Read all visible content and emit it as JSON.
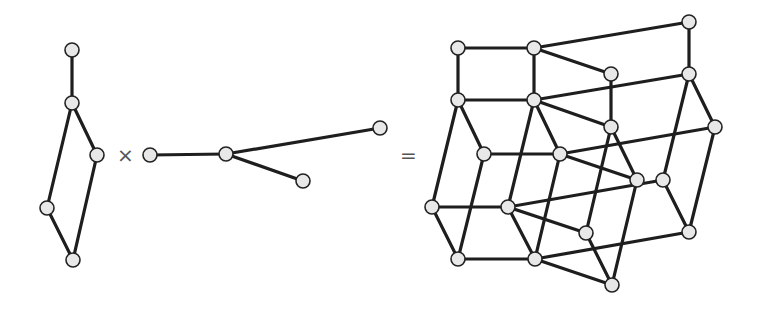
{
  "diagram": {
    "colors": {
      "edge": "#1e1e1e",
      "node_fill": "#e8e8e8",
      "node_stroke": "#222222",
      "operator": "#555555"
    },
    "node_radius": 7,
    "operators": [
      {
        "name": "times-operator",
        "symbol": "×",
        "x": 117,
        "y": 145
      },
      {
        "name": "equals-operator",
        "symbol": "=",
        "x": 400,
        "y": 145
      }
    ],
    "graphs": [
      {
        "name": "graph-g",
        "nodes": [
          [
            72,
            50
          ],
          [
            72,
            103
          ],
          [
            97,
            155
          ],
          [
            47,
            208
          ],
          [
            73,
            260
          ]
        ],
        "edges": [
          [
            0,
            1
          ],
          [
            1,
            2
          ],
          [
            1,
            3
          ],
          [
            2,
            4
          ],
          [
            3,
            4
          ]
        ]
      },
      {
        "name": "graph-h",
        "nodes": [
          [
            150,
            155
          ],
          [
            226,
            154
          ],
          [
            380,
            128
          ],
          [
            303,
            181
          ]
        ],
        "edges": [
          [
            0,
            1
          ],
          [
            1,
            2
          ],
          [
            1,
            3
          ]
        ]
      },
      {
        "name": "product-graph",
        "nodes": [
          [
            458,
            48
          ],
          [
            458,
            100
          ],
          [
            484,
            154
          ],
          [
            432,
            207
          ],
          [
            458,
            259
          ],
          [
            534,
            48
          ],
          [
            534,
            100
          ],
          [
            560,
            154
          ],
          [
            508,
            207
          ],
          [
            535,
            259
          ],
          [
            689,
            22
          ],
          [
            689,
            74
          ],
          [
            715,
            127
          ],
          [
            663,
            180
          ],
          [
            689,
            232
          ],
          [
            611,
            74
          ],
          [
            611,
            127
          ],
          [
            637,
            180
          ],
          [
            586,
            233
          ],
          [
            612,
            285
          ]
        ],
        "edges": [
          [
            0,
            1
          ],
          [
            1,
            2
          ],
          [
            1,
            3
          ],
          [
            2,
            4
          ],
          [
            3,
            4
          ],
          [
            5,
            6
          ],
          [
            6,
            7
          ],
          [
            6,
            8
          ],
          [
            7,
            9
          ],
          [
            8,
            9
          ],
          [
            10,
            11
          ],
          [
            11,
            12
          ],
          [
            11,
            13
          ],
          [
            12,
            14
          ],
          [
            13,
            14
          ],
          [
            15,
            16
          ],
          [
            16,
            17
          ],
          [
            16,
            18
          ],
          [
            17,
            19
          ],
          [
            18,
            19
          ],
          [
            0,
            5
          ],
          [
            1,
            6
          ],
          [
            2,
            7
          ],
          [
            3,
            8
          ],
          [
            4,
            9
          ],
          [
            5,
            10
          ],
          [
            6,
            11
          ],
          [
            7,
            12
          ],
          [
            8,
            13
          ],
          [
            9,
            14
          ],
          [
            5,
            15
          ],
          [
            6,
            16
          ],
          [
            7,
            17
          ],
          [
            8,
            18
          ],
          [
            9,
            19
          ]
        ]
      }
    ]
  }
}
